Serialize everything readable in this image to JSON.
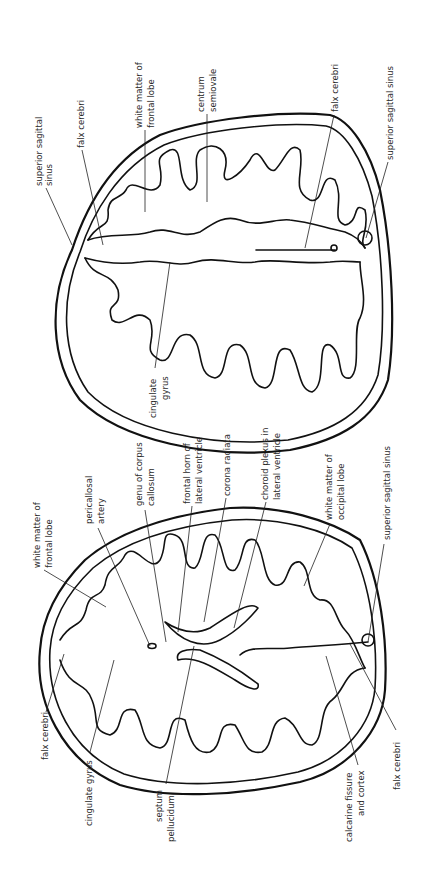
{
  "figure": {
    "orientation": "rotated 90 degrees counter-clockwise",
    "panels": [
      {
        "id": "top",
        "description": "Axial section at level of centrum semiovale",
        "labels": [
          "superior sagittal sinus",
          "falx cerebri",
          "white matter of frontal lobe",
          "centrum semiovale",
          "falx cerebri",
          "superior sagittal sinus",
          "cingulate gyrus"
        ]
      },
      {
        "id": "bottom",
        "description": "Axial section at level of lateral ventricles",
        "labels": [
          "white matter of frontal lobe",
          "pericallosal artery",
          "genu of corpus callosum",
          "frontal horn of lateral ventricle",
          "corona radiata",
          "choroid plexus in lateral ventricle",
          "white matter of occipital lobe",
          "superior sagittal sinus",
          "falx cerebri",
          "cingulate gyrus",
          "septum pellucidum",
          "calcarine fissure and cortex",
          "falx cerebri"
        ]
      }
    ]
  },
  "top": {
    "sss_1a": "superior sagittal",
    "sss_1b": "sinus",
    "falx_1": "falx cerebri",
    "wm_frontal_a": "white matter of",
    "wm_frontal_b": "frontal lobe",
    "centrum_a": "centrum",
    "centrum_b": "semiovale",
    "falx_2": "falx cerebri",
    "sss_2": "superior sagittal sinus",
    "cingulate_a": "cingulate",
    "cingulate_b": "gyrus"
  },
  "bottom": {
    "wm_frontal_a": "white matter of",
    "wm_frontal_b": "frontal lobe",
    "pericallosal_a": "pericallosal",
    "pericallosal_b": "artery",
    "genu_a": "genu of corpus",
    "genu_b": "callosum",
    "frontal_horn_a": "frontal horn of",
    "frontal_horn_b": "lateral ventricle",
    "corona": "corona radiata",
    "choroid_a": "choroid plexus in",
    "choroid_b": "lateral ventricle",
    "wm_occipital_a": "white matter of",
    "wm_occipital_b": "occipital lobe",
    "sss": "superior sagittal sinus",
    "falx_1": "falx cerebri",
    "cingulate": "cingulate gyrus",
    "septum_a": "septum",
    "septum_b": "pellucidum",
    "calcarine_a": "calcarine fissure",
    "calcarine_b": "and cortex",
    "falx_2": "falx cerebri"
  }
}
